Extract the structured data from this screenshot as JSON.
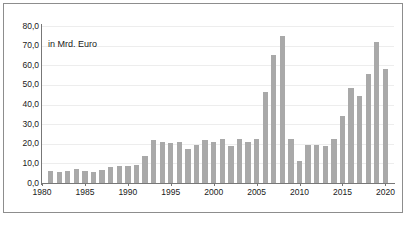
{
  "annotation": "in Mrd. Euro",
  "axis": {
    "y_ticks": [
      "0,0",
      "10,0",
      "20,0",
      "30,0",
      "40,0",
      "50,0",
      "60,0",
      "70,0",
      "80,0"
    ],
    "x_ticks": [
      "1980",
      "1985",
      "1990",
      "1995",
      "2000",
      "2005",
      "2010",
      "2015",
      "2020"
    ]
  },
  "colors": {
    "bar": "#a9a9a9",
    "grid": "#ededed",
    "axis": "#777777",
    "frame": "#8d8d8d",
    "background": "#ffffff",
    "text": "#1a1a1a"
  },
  "chart_data": {
    "type": "bar",
    "title": "",
    "subtitle": "",
    "xlabel": "",
    "ylabel": "in Mrd. Euro",
    "annotations": [
      "in Mrd. Euro"
    ],
    "grid": true,
    "legend": null,
    "ylim": [
      0,
      80
    ],
    "ytick_values": [
      0,
      10,
      20,
      30,
      40,
      50,
      60,
      70,
      80
    ],
    "ytick_labels": [
      "0,0",
      "10,0",
      "20,0",
      "30,0",
      "40,0",
      "50,0",
      "60,0",
      "70,0",
      "80,0"
    ],
    "xlim": [
      1980,
      2021
    ],
    "xtick_values": [
      1980,
      1985,
      1990,
      1995,
      2000,
      2005,
      2010,
      2015,
      2020
    ],
    "xtick_labels": [
      "1980",
      "1985",
      "1990",
      "1995",
      "2000",
      "2005",
      "2010",
      "2015",
      "2020"
    ],
    "categories": [
      "1981",
      "1982",
      "1983",
      "1984",
      "1985",
      "1986",
      "1987",
      "1988",
      "1989",
      "1990",
      "1991",
      "1992",
      "1993",
      "1994",
      "1995",
      "1996",
      "1997",
      "1998",
      "1999",
      "2000",
      "2001",
      "2002",
      "2003",
      "2004",
      "2005",
      "2006",
      "2007",
      "2008",
      "2009",
      "2010",
      "2011",
      "2012",
      "2013",
      "2014",
      "2015",
      "2016",
      "2017",
      "2018",
      "2019",
      "2020"
    ],
    "values": [
      6.0,
      5.8,
      6.2,
      7.3,
      6.3,
      5.8,
      6.5,
      8.0,
      8.8,
      8.8,
      9.0,
      14.0,
      21.8,
      21.0,
      20.5,
      21.0,
      17.5,
      19.5,
      22.0,
      21.0,
      22.5,
      19.0,
      22.5,
      21.0,
      22.5,
      46.5,
      65.0,
      75.0,
      22.5,
      11.0,
      19.5,
      19.5,
      19.0,
      22.5,
      34.0,
      48.5,
      44.5,
      55.5,
      72.0,
      58.0
    ]
  }
}
